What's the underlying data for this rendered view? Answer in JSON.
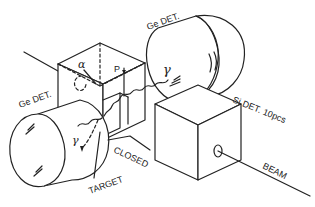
{
  "diagram": {
    "labels": {
      "ge_det_top": "Ge DET.",
      "ge_det_left": "Ge DET.",
      "si_det": "Si DET. 10pcs",
      "beam": "BEAM",
      "closed": "CLOSED",
      "target": "TARGET",
      "p": "P",
      "alpha": "α",
      "gamma_top": "γ",
      "gamma_left": "γ"
    },
    "colors": {
      "line": "#222222",
      "background": "#ffffff"
    }
  }
}
